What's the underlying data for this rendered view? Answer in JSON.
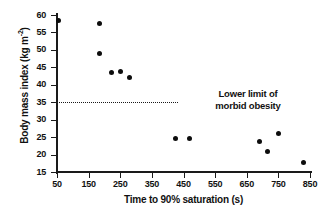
{
  "chart_data": {
    "type": "scatter",
    "title": "",
    "xlabel": "Time to 90% saturation (s)",
    "ylabel": "Body mass index (kg m-2)",
    "ylabel_main": "Body mass index (kg m",
    "ylabel_sup": "-2",
    "ylabel_tail": ")",
    "xlim": [
      50,
      850
    ],
    "ylim": [
      15,
      60
    ],
    "grid": false,
    "legend": null,
    "xticks": [
      50,
      150,
      250,
      350,
      450,
      550,
      650,
      750,
      850
    ],
    "yticks": [
      15,
      20,
      25,
      30,
      35,
      40,
      45,
      50,
      55,
      60
    ],
    "xtick_labels": [
      "50",
      "150",
      "250",
      "350",
      "450",
      "550",
      "650",
      "750",
      "850"
    ],
    "ytick_labels": [
      "15",
      "20",
      "25",
      "30",
      "35",
      "40",
      "45",
      "50",
      "55",
      "60"
    ],
    "points": [
      {
        "x": 55,
        "y": 58.5
      },
      {
        "x": 185,
        "y": 57.7
      },
      {
        "x": 185,
        "y": 49.0
      },
      {
        "x": 222,
        "y": 43.6
      },
      {
        "x": 250,
        "y": 43.8
      },
      {
        "x": 280,
        "y": 42.0
      },
      {
        "x": 425,
        "y": 24.6
      },
      {
        "x": 470,
        "y": 24.7
      },
      {
        "x": 690,
        "y": 23.7
      },
      {
        "x": 715,
        "y": 21.0
      },
      {
        "x": 750,
        "y": 26.0
      },
      {
        "x": 830,
        "y": 17.8
      }
    ],
    "annotations": [
      {
        "kind": "threshold-line",
        "y": 35,
        "style": "dotted",
        "label_line1": "Lower limit of",
        "label_line2": "morbid obesity"
      }
    ],
    "colors": {
      "marker": "#0d0d0d",
      "axis": "#1a1a1a",
      "text": "#111111",
      "background": "#ffffff"
    }
  }
}
